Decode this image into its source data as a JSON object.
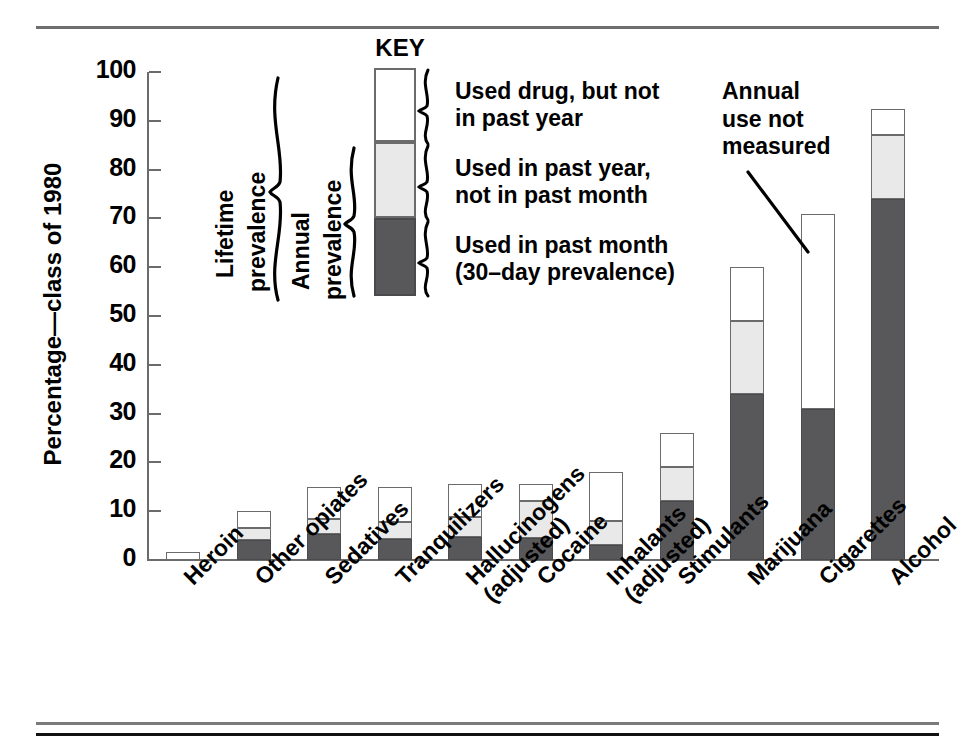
{
  "chart_data": {
    "type": "bar",
    "stacked": true,
    "title": "",
    "xlabel": "",
    "ylabel": "Percentage—class of 1980",
    "ylim": [
      0,
      100
    ],
    "yticks": [
      0,
      10,
      20,
      30,
      40,
      50,
      60,
      70,
      80,
      90,
      100
    ],
    "grid": false,
    "legend_position": "inside-top-left",
    "categories": [
      "Heroin",
      "Other opiates",
      "Sedatives",
      "Tranquilizers",
      "Hallucinogens (adjusted)",
      "Cocaine",
      "Inhalants (adjusted)",
      "Stimulants",
      "Marijuana",
      "Cigarettes",
      "Alcohol"
    ],
    "category_lines": [
      [
        "Heroin"
      ],
      [
        "Other opiates"
      ],
      [
        "Sedatives"
      ],
      [
        "Tranquilizers"
      ],
      [
        "Hallucinogens",
        "(adjusted)"
      ],
      [
        "Cocaine"
      ],
      [
        "Inhalants",
        "(adjusted)"
      ],
      [
        "Stimulants"
      ],
      [
        "Marijuana"
      ],
      [
        "Cigarettes"
      ],
      [
        "Alcohol"
      ]
    ],
    "series": [
      {
        "name": "Used in past month (30-day prevalence)",
        "key": "past_month",
        "color": "#58585a",
        "values": [
          0,
          4.0,
          5.4,
          4.4,
          4.8,
          4.6,
          3.0,
          12.0,
          34.0,
          31.0,
          74.0
        ]
      },
      {
        "name": "Used in past year, not in past month",
        "key": "past_year_not_month",
        "color": "#e9e9e9",
        "values": [
          0,
          2.5,
          3.0,
          3.4,
          4.0,
          7.5,
          5.0,
          7.0,
          15.0,
          0,
          13.0
        ]
      },
      {
        "name": "Used drug, but not in past year",
        "key": "not_past_year",
        "color": "#ffffff",
        "values": [
          1.6,
          3.5,
          6.6,
          7.2,
          6.7,
          3.4,
          10.0,
          7.0,
          11.0,
          40.0,
          5.5
        ]
      }
    ],
    "totals": [
      1.6,
      10.0,
      15.0,
      15.0,
      15.5,
      15.5,
      18.0,
      26.0,
      60.0,
      71.0,
      92.5
    ],
    "annotations": [
      {
        "name": "annual-use-not-measured",
        "lines": [
          "Annual",
          "use not",
          "measured"
        ],
        "points_to": "Cigarettes"
      }
    ]
  },
  "key": {
    "title": "KEY",
    "segments": [
      {
        "fill": "white",
        "label_lines": [
          "Used drug, but not",
          "in past year"
        ]
      },
      {
        "fill": "light",
        "label_lines": [
          "Used in past year,",
          "not in past month"
        ]
      },
      {
        "fill": "dark",
        "label_lines": [
          "Used in past month",
          "(30–day prevalence)"
        ]
      }
    ],
    "brackets": [
      {
        "name": "lifetime-prevalence",
        "lines": [
          "Lifetime",
          "prevalence"
        ]
      },
      {
        "name": "annual-prevalence",
        "lines": [
          "Annual",
          "prevalence"
        ]
      }
    ]
  },
  "colors": {
    "dark": "#58585a",
    "light": "#e9e9e9",
    "white": "#ffffff",
    "outline": "#6b6b6b",
    "rule": "#111111"
  }
}
